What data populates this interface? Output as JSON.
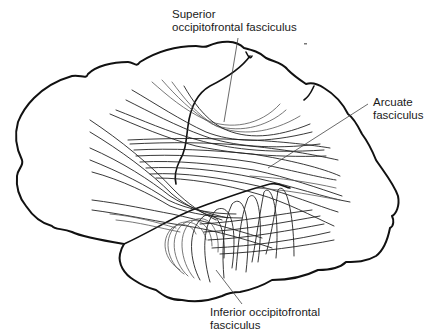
{
  "figure": {
    "colors": {
      "line": "#111111",
      "background": "#ffffff"
    }
  },
  "labels": {
    "superior": {
      "line1": "Superior",
      "line2": "occipitofrontal fasciculus"
    },
    "arcuate": {
      "line1": "Arcuate",
      "line2": "fasciculus"
    },
    "inferior": {
      "line1": "Inferior occipitofrontal",
      "line2": "fasciculus"
    }
  }
}
